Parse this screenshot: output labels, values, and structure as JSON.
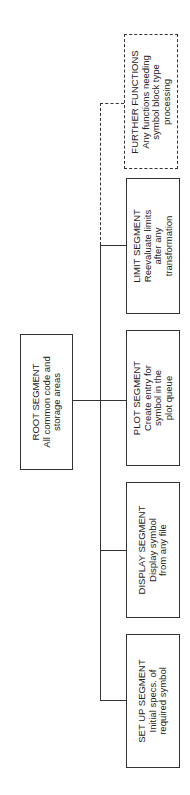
{
  "diagram": {
    "type": "hierarchy",
    "orientation": "rotated-90-ccw",
    "root": {
      "title": "ROOT SEGMENT",
      "lines": [
        "All common code and",
        "storage areas"
      ]
    },
    "children": [
      {
        "title": "FURTHER FUNCTIONS",
        "lines": [
          "Any functions needing",
          "symbol block type",
          "processing"
        ],
        "style": "dashed"
      },
      {
        "title": "LIMIT SEGMENT",
        "lines": [
          "Reevaluate limits",
          "after any",
          "transformation"
        ],
        "style": "solid"
      },
      {
        "title": "PLOT SEGMENT",
        "lines": [
          "Create entry for",
          "symbol in the",
          "plot queue"
        ],
        "style": "solid"
      },
      {
        "title": "DISPLAY SEGMENT",
        "lines": [
          "Display symbol",
          "from any file"
        ],
        "style": "solid"
      },
      {
        "title": "SET UP SEGMENT",
        "lines": [
          "Initial specs. of",
          "required symbol"
        ],
        "style": "solid"
      }
    ]
  }
}
